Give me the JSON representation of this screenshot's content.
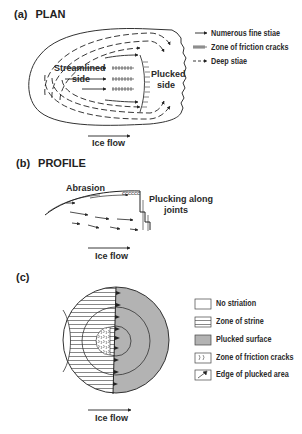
{
  "panel_a": {
    "letter": "(a)",
    "title": "PLAN",
    "label_streamlined_1": "Streamlined",
    "label_streamlined_2": "side",
    "label_plucked_1": "Plucked",
    "label_plucked_2": "side",
    "ice_flow": "Ice flow",
    "legend": [
      {
        "icon": "solid-arrow",
        "label": "Numerous fine stiae"
      },
      {
        "icon": "friction-crack-arrow",
        "label": "Zone of friction cracks"
      },
      {
        "icon": "dashed-arrow",
        "label": "Deep stiae"
      }
    ]
  },
  "panel_b": {
    "letter": "(b)",
    "title": "PROFILE",
    "label_abrasion": "Abrasion",
    "label_plucking_1": "Plucking along",
    "label_plucking_2": "joints",
    "ice_flow": "Ice flow"
  },
  "panel_c": {
    "letter": "(c)",
    "ice_flow": "Ice flow",
    "legend": [
      {
        "swatch": "blank",
        "label": "No striation"
      },
      {
        "swatch": "horizontal-lines",
        "label": "Zone of strine"
      },
      {
        "swatch": "grey-fill",
        "label": "Plucked surface"
      },
      {
        "swatch": "crack-marks",
        "label": "Zone of friction cracks"
      },
      {
        "swatch": "edge-triangle",
        "label": "Edge of plucked area"
      }
    ],
    "colors": {
      "plucked": "#b3b3b3",
      "line": "#333333"
    }
  }
}
